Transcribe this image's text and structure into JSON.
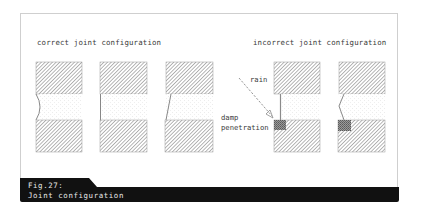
{
  "figure": {
    "number": "Fig.27:",
    "title": "Joint configuration"
  },
  "sections": {
    "correct": {
      "heading": "correct joint configuration"
    },
    "incorrect": {
      "heading": "incorrect joint configuration"
    }
  },
  "annotations": {
    "rain": "rain",
    "damp_line1": "damp",
    "damp_line2": "penetration"
  },
  "colors": {
    "frame_border": "#cfcfcf",
    "hatch": "#8a8a8a",
    "caption_bg": "#111111",
    "caption_text": "#e8e8e8",
    "damp_fill": "#6f6f6f"
  },
  "joints": [
    {
      "id": "correct-concave",
      "group": "correct",
      "profile": "concave"
    },
    {
      "id": "correct-flush",
      "group": "correct",
      "profile": "flush"
    },
    {
      "id": "correct-weathered",
      "group": "correct",
      "profile": "weathered"
    },
    {
      "id": "incorrect-raked",
      "group": "incorrect",
      "profile": "recessed",
      "damp_penetration": true
    },
    {
      "id": "incorrect-v",
      "group": "incorrect",
      "profile": "v-struck",
      "damp_penetration": true
    }
  ]
}
